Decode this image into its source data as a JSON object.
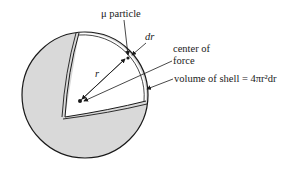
{
  "diagram": {
    "type": "cutaway-sphere",
    "colors": {
      "sphere_fill": "#d9d9d9",
      "cutout_fill": "#ffffff",
      "stroke": "#1a1a1a"
    },
    "labels": {
      "particle": "μ particle",
      "thickness": "dr",
      "radius": "r",
      "center_line1": "center of",
      "center_line2": "force",
      "shell_volume": "volume of shell = 4πr²dr"
    }
  }
}
